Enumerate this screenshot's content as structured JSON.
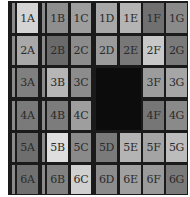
{
  "board": {
    "rows": [
      "1",
      "2",
      "3",
      "4",
      "5",
      "6"
    ],
    "columns": [
      "A",
      "B",
      "C",
      "D",
      "E",
      "F",
      "G"
    ],
    "missing_tiles": [
      "3D",
      "3E",
      "4D",
      "4E"
    ],
    "tiles": [
      {
        "id": "1A",
        "label": "1A",
        "shade": "#d4d4d4"
      },
      {
        "id": "1B",
        "label": "1B",
        "shade": "#8e8e8e"
      },
      {
        "id": "1C",
        "label": "1C",
        "shade": "#9e9e9e"
      },
      {
        "id": "1D",
        "label": "1D",
        "shade": "#a8a8a8"
      },
      {
        "id": "1E",
        "label": "1E",
        "shade": "#b4b4b4"
      },
      {
        "id": "1F",
        "label": "1F",
        "shade": "#707070"
      },
      {
        "id": "1G",
        "label": "1G",
        "shade": "#8a8a8a"
      },
      {
        "id": "2A",
        "label": "2A",
        "shade": "#a8a8a8"
      },
      {
        "id": "2B",
        "label": "2B",
        "shade": "#6a6a6a"
      },
      {
        "id": "2C",
        "label": "2C",
        "shade": "#8c8c8c"
      },
      {
        "id": "2D",
        "label": "2D",
        "shade": "#9a9a9a"
      },
      {
        "id": "2E",
        "label": "2E",
        "shade": "#787878"
      },
      {
        "id": "2F",
        "label": "2F",
        "shade": "#c8c8c8"
      },
      {
        "id": "2G",
        "label": "2G",
        "shade": "#7a7a7a"
      },
      {
        "id": "3A",
        "label": "3A",
        "shade": "#808080"
      },
      {
        "id": "3B",
        "label": "3B",
        "shade": "#b6b6b6"
      },
      {
        "id": "3C",
        "label": "3C",
        "shade": "#8c8c8c"
      },
      {
        "id": "3F",
        "label": "3F",
        "shade": "#9c9c9c"
      },
      {
        "id": "3G",
        "label": "3G",
        "shade": "#a6a6a6"
      },
      {
        "id": "4A",
        "label": "4A",
        "shade": "#7a7a7a"
      },
      {
        "id": "4B",
        "label": "4B",
        "shade": "#7c7c7c"
      },
      {
        "id": "4C",
        "label": "4C",
        "shade": "#9e9e9e"
      },
      {
        "id": "4F",
        "label": "4F",
        "shade": "#767676"
      },
      {
        "id": "4G",
        "label": "4G",
        "shade": "#8a8a8a"
      },
      {
        "id": "5A",
        "label": "5A",
        "shade": "#6e6e6e"
      },
      {
        "id": "5B",
        "label": "5B",
        "shade": "#dedede"
      },
      {
        "id": "5C",
        "label": "5C",
        "shade": "#8a8a8a"
      },
      {
        "id": "5D",
        "label": "5D",
        "shade": "#7a7a7a"
      },
      {
        "id": "5E",
        "label": "5E",
        "shade": "#b4b4b4"
      },
      {
        "id": "5F",
        "label": "5F",
        "shade": "#a4a4a4"
      },
      {
        "id": "5G",
        "label": "5G",
        "shade": "#bcbcbc"
      },
      {
        "id": "6A",
        "label": "6A",
        "shade": "#707070"
      },
      {
        "id": "6B",
        "label": "6B",
        "shade": "#828282"
      },
      {
        "id": "6C",
        "label": "6C",
        "shade": "#d0d0d0"
      },
      {
        "id": "6D",
        "label": "6D",
        "shade": "#8c8c8c"
      },
      {
        "id": "6E",
        "label": "6E",
        "shade": "#a0a0a0"
      },
      {
        "id": "6F",
        "label": "6F",
        "shade": "#9a9a9a"
      },
      {
        "id": "6G",
        "label": "6G",
        "shade": "#7a7a7a"
      }
    ]
  },
  "colors": {
    "board_background": "#1a1a1a",
    "hole": "#0c0c0c",
    "strip": "#8a8a8a",
    "text": "#2a2a2a"
  }
}
